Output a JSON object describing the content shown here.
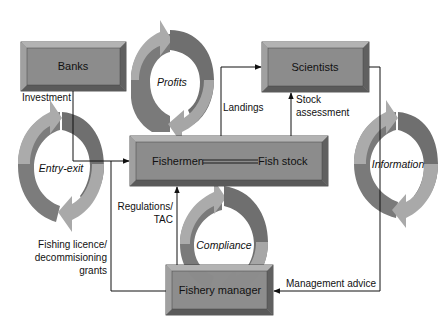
{
  "diagram": {
    "type": "fishery-management-system",
    "nodes": {
      "banks": {
        "label": "Banks"
      },
      "scientists": {
        "label": "Scientists"
      },
      "fishermen": {
        "label": "Fishermen"
      },
      "fish_stock": {
        "label": "Fish stock"
      },
      "fishery_manager": {
        "label": "Fishery manager"
      }
    },
    "cycles": {
      "profits": {
        "label": "Profits"
      },
      "entry_exit": {
        "label": "Entry-exit"
      },
      "information": {
        "label": "Information"
      },
      "compliance": {
        "label": "Compliance"
      }
    },
    "edges": {
      "investment": {
        "label": "Investment",
        "from": "Banks",
        "to": "Fishermen"
      },
      "landings": {
        "label": "Landings",
        "from": "Fishermen",
        "to": "Scientists"
      },
      "stock_assessment": {
        "line1": "Stock",
        "line2": "assessment",
        "from": "Fishermen",
        "to": "Scientists"
      },
      "regulations": {
        "line1": "Regulations/",
        "line2": "TAC",
        "from": "Fishery manager",
        "to": "Fishermen"
      },
      "licence": {
        "line1": "Fishing licence/",
        "line2": "decommisioning",
        "line3": "grants",
        "from": "Fishery manager",
        "to": "Fishermen"
      },
      "management_advice": {
        "label": "Management advice",
        "from": "Scientists",
        "to": "Fishery manager"
      }
    },
    "colors": {
      "box_face": "#8a8a8a",
      "box_bevel_light": "#b5b5b5",
      "box_bevel_dark": "#5e5e5e",
      "arrow_light": "#a9a9a9",
      "arrow_dark": "#777777",
      "line": "#111111"
    }
  }
}
